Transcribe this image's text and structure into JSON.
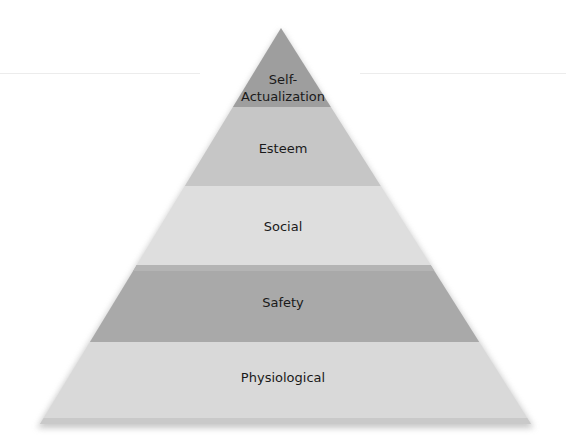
{
  "diagram": {
    "type": "pyramid",
    "levels": [
      {
        "label_line1": "Self-",
        "label_line2": "Actualization",
        "color": "#9e9e9e"
      },
      {
        "label": "Esteem",
        "color": "#c6c6c6"
      },
      {
        "label": "Social",
        "color": "#dedede"
      },
      {
        "label": "Safety",
        "color": "#a9a9a9"
      },
      {
        "label": "Physiological",
        "color": "#d9d9d9"
      }
    ]
  }
}
